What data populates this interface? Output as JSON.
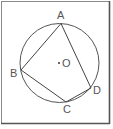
{
  "diagram": {
    "type": "inscribed-quadrilateral",
    "circle": {
      "center_label": "O",
      "cx": 59.5,
      "cy": 63,
      "r": 39.5
    },
    "points": [
      {
        "label": "A",
        "x": 61,
        "y": 23.5,
        "label_x": 57,
        "label_y": 19
      },
      {
        "label": "B",
        "x": 21,
        "y": 70,
        "label_x": 10,
        "label_y": 77
      },
      {
        "label": "C",
        "x": 66,
        "y": 102,
        "label_x": 63,
        "label_y": 113
      },
      {
        "label": "D",
        "x": 91,
        "y": 88,
        "label_x": 93,
        "label_y": 94
      }
    ],
    "edges": [
      "AB",
      "BC",
      "CD",
      "DA"
    ],
    "center": {
      "label": "O",
      "dot_x": 59,
      "dot_y": 63,
      "label_x": 62,
      "label_y": 67
    },
    "colors": {
      "stroke": "#444444",
      "frame": "#555555",
      "text": "#555555"
    }
  }
}
